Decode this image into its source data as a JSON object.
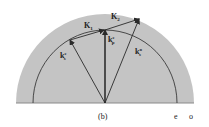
{
  "figure": {
    "caption": "(b)",
    "colors": {
      "fill": "#c4c4c4",
      "stroke": "#2a2a2a",
      "background": "#ffffff"
    },
    "surfaces": [
      {
        "name": "outer",
        "label": "o",
        "radius_px": 89
      },
      {
        "name": "inner",
        "label": "e",
        "radius_px": 72
      }
    ],
    "vectors": [
      {
        "name": "k_s_e",
        "base": "k",
        "sup": "e",
        "sub": "s"
      },
      {
        "name": "k_p_e",
        "base": "k",
        "sup": "e",
        "sub": "p"
      },
      {
        "name": "k_s_o",
        "base": "k",
        "sup": "o",
        "sub": "s"
      },
      {
        "name": "K1",
        "base": "K",
        "sub": "1"
      },
      {
        "name": "K2",
        "base": "K",
        "sub": "2"
      }
    ]
  }
}
